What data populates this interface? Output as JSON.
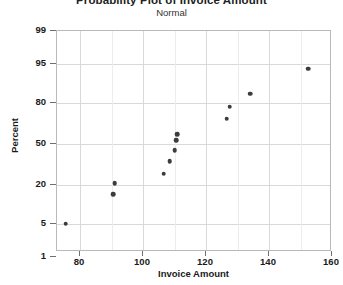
{
  "chart_data": {
    "type": "scatter",
    "title": "Probability Plot of Invoice Amount",
    "subtitle": "Normal",
    "xlabel": "Invoice Amount",
    "ylabel": "Percent",
    "grid": true,
    "legend": "none",
    "xlim": [
      72,
      160
    ],
    "ylim": [
      1,
      99
    ],
    "yscale": "normal-probability",
    "xticks": [
      80,
      100,
      120,
      140,
      160
    ],
    "xtick_labels": [
      "80",
      "100",
      "120",
      "140",
      "160"
    ],
    "yticks": [
      1,
      5,
      20,
      50,
      80,
      95,
      99
    ],
    "ytick_labels": [
      "1",
      "5",
      "20",
      "50",
      "80",
      "95",
      "99"
    ],
    "points": [
      {
        "x": 75.5,
        "percent": 5.0
      },
      {
        "x": 90.5,
        "percent": 15.0
      },
      {
        "x": 91.0,
        "percent": 21.0
      },
      {
        "x": 106.5,
        "percent": 27.0
      },
      {
        "x": 108.5,
        "percent": 36.0
      },
      {
        "x": 110.0,
        "percent": 45.0
      },
      {
        "x": 110.5,
        "percent": 53.0
      },
      {
        "x": 110.8,
        "percent": 58.0
      },
      {
        "x": 126.5,
        "percent": 70.0
      },
      {
        "x": 127.5,
        "percent": 78.0
      },
      {
        "x": 134.0,
        "percent": 85.0
      },
      {
        "x": 152.5,
        "percent": 94.0
      }
    ]
  },
  "axes": {
    "y_title": "Percent",
    "x_title": "Invoice Amount"
  }
}
